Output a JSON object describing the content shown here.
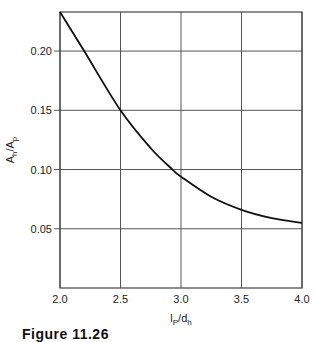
{
  "chart_data": {
    "type": "line",
    "title": "",
    "xlabel": "l_p/d_h",
    "ylabel": "A_h/A_p",
    "xlim": [
      2.0,
      4.0
    ],
    "ylim": [
      0.0,
      0.233
    ],
    "grid": true,
    "legend": null,
    "x_ticks": [
      2.0,
      2.5,
      3.0,
      3.5,
      4.0
    ],
    "x_tick_labels": [
      "2.0",
      "2.5",
      "3.0",
      "3.5",
      "4.0"
    ],
    "y_ticks": [
      0.05,
      0.1,
      0.15,
      0.2
    ],
    "y_tick_labels": [
      "0.05",
      "0.10",
      "0.15",
      "0.20"
    ],
    "series": [
      {
        "name": "A_h/A_p vs l_p/d_h",
        "color": "#111111",
        "x": [
          2.0,
          2.2,
          2.5,
          2.75,
          2.93,
          3.0,
          3.25,
          3.5,
          3.75,
          4.0
        ],
        "y": [
          0.233,
          0.2,
          0.15,
          0.118,
          0.1,
          0.094,
          0.077,
          0.066,
          0.059,
          0.055
        ]
      }
    ]
  },
  "labels": {
    "x_main": "l",
    "x_sub1": "P",
    "x_mid": "/d",
    "x_sub2": "h",
    "y_main": "A",
    "y_sub1": "h",
    "y_mid": "/A",
    "y_sub2": "p"
  },
  "caption": {
    "text": "Figure 11.26",
    "clipped": true
  },
  "colors": {
    "grid": "#555555",
    "frame": "#444444",
    "curve": "#111111",
    "background": "#ffffff"
  }
}
